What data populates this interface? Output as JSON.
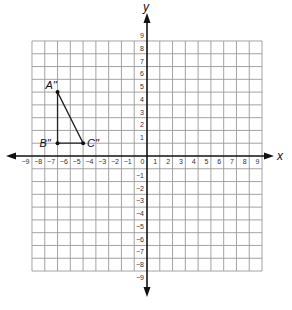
{
  "chart_data": {
    "type": "scatter",
    "title": "",
    "xlabel": "x",
    "ylabel": "y",
    "xlim": [
      -9,
      9
    ],
    "ylim": [
      -9,
      9
    ],
    "grid": true,
    "x_ticks": [
      -9,
      -8,
      -7,
      -6,
      -5,
      -4,
      -3,
      -2,
      -1,
      0,
      1,
      2,
      3,
      4,
      5,
      6,
      7,
      8,
      9
    ],
    "y_ticks": [
      9,
      8,
      7,
      6,
      5,
      4,
      3,
      2,
      1,
      -1,
      -2,
      -3,
      -4,
      -5,
      -6,
      -7,
      -8,
      -9
    ],
    "points": [
      {
        "label": "A\"",
        "x": -7,
        "y": 5
      },
      {
        "label": "B\"",
        "x": -7,
        "y": 1
      },
      {
        "label": "C\"",
        "x": -5,
        "y": 1
      }
    ],
    "polygon": [
      "A\"",
      "B\"",
      "C\""
    ]
  },
  "axes": {
    "x_label": "x",
    "y_label": "y"
  },
  "colors": {
    "grid": "#9a9a9a",
    "axis": "#111111",
    "shape": "#222222"
  }
}
